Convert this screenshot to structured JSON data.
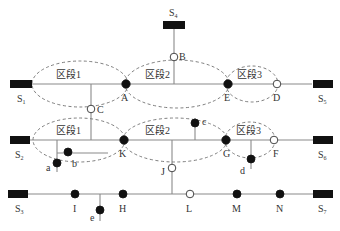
{
  "diagram": {
    "sources": [
      {
        "id": "S1",
        "label": "S",
        "sub": "1"
      },
      {
        "id": "S2",
        "label": "S",
        "sub": "2"
      },
      {
        "id": "S3",
        "label": "S",
        "sub": "3"
      },
      {
        "id": "S4",
        "label": "S",
        "sub": "4"
      },
      {
        "id": "S5",
        "label": "S",
        "sub": "5"
      },
      {
        "id": "S6",
        "label": "S",
        "sub": "6"
      },
      {
        "id": "S7",
        "label": "S",
        "sub": "7"
      }
    ],
    "switches_closed": [
      "A",
      "E",
      "K",
      "G",
      "a",
      "b",
      "c",
      "d",
      "e",
      "I",
      "H",
      "M",
      "N"
    ],
    "switches_open": [
      "B",
      "C",
      "D",
      "F",
      "J",
      "L"
    ],
    "node_labels": {
      "A": "A",
      "B": "B",
      "C": "C",
      "D": "D",
      "E": "E",
      "F": "F",
      "G": "G",
      "H": "H",
      "I": "I",
      "J": "J",
      "K": "K",
      "L": "L",
      "M": "M",
      "N": "N",
      "a": "a",
      "b": "b",
      "c": "c",
      "d": "d",
      "e": "e"
    },
    "segments": {
      "row1": [
        "区段1",
        "区段2",
        "区段3"
      ],
      "row2": [
        "区段1",
        "区段2",
        "区段3"
      ]
    }
  }
}
